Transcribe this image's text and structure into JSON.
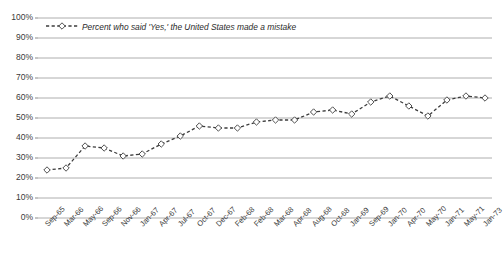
{
  "chart_data": {
    "type": "line",
    "title": "",
    "subtitle": "",
    "xlabel": "",
    "ylabel": "",
    "ylim": [
      0,
      100
    ],
    "ytick_labels": [
      "100%",
      "90%",
      "80%",
      "70%",
      "60%",
      "50%",
      "40%",
      "30%",
      "20%",
      "10%",
      "0%"
    ],
    "ytick_values": [
      100,
      90,
      80,
      70,
      60,
      50,
      40,
      30,
      20,
      10,
      0
    ],
    "grid": "horizontal",
    "legend_position": "top-left",
    "legend": [
      "Percent who said 'Yes,' the United States made a mistake"
    ],
    "categories": [
      "Sep-65",
      "Mar-66",
      "May-66",
      "Sep-66",
      "Nov-66",
      "Jan-67",
      "Apr-67",
      "Jul-67",
      "Oct-67",
      "Dec-67",
      "Feb-68",
      "Feb-68",
      "Mar-68",
      "Apr-68",
      "Aug-68",
      "Oct-68",
      "Jan-69",
      "Sep-69",
      "Jan-70",
      "Apr-70",
      "May-70",
      "Jan-71",
      "May-71",
      "Jan-73"
    ],
    "series": [
      {
        "name": "Percent who said 'Yes,' the United States made a mistake",
        "values": [
          24,
          25,
          36,
          35,
          31,
          32,
          37,
          41,
          46,
          45,
          45,
          48,
          49,
          49,
          53,
          54,
          52,
          58,
          61,
          56,
          51,
          59,
          61,
          60
        ]
      }
    ],
    "marker": "diamond-open",
    "line_style": "dashed",
    "line_color": "#3c3c3c"
  },
  "legend": {
    "label": "Percent who said 'Yes,' the United States made a mistake"
  }
}
